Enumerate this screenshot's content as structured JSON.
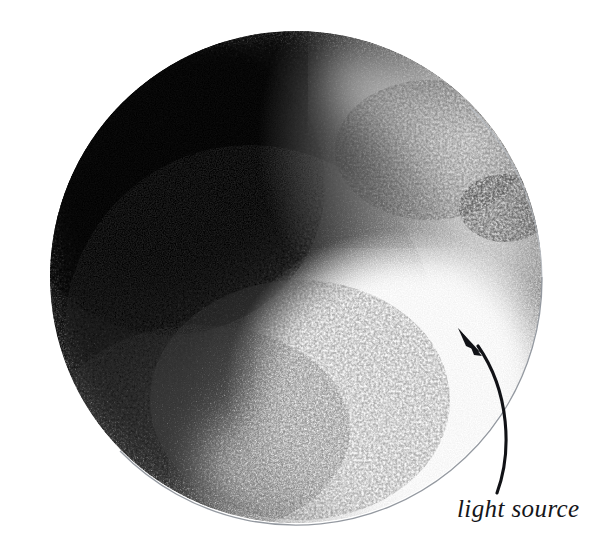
{
  "figure": {
    "kind": "pencil-shaded-sphere-diagram",
    "medium": "graphite / charcoal shading on white paper",
    "background_color": "#ffffff",
    "caption_text": "light source"
  },
  "sphere": {
    "name": "shaded-sphere",
    "center_x": 296,
    "center_y": 277,
    "radius": 246,
    "outline_color": "#9aa0a6",
    "outline_visible_arc": "lower-right",
    "core_shadow_color": "#0a0a0a",
    "midtone_color": "#4a4a4a",
    "highlight_color": "#ffffff",
    "reflected_light_color": "#c9c9c9",
    "shading_direction": "dark upper-left to light lower-right",
    "highlight_center_x": 390,
    "highlight_center_y": 380
  },
  "annotation": {
    "name": "light-source-annotation",
    "label": "light source",
    "label_x": 457,
    "label_y": 496,
    "arrow": {
      "color": "#111216",
      "tip_x": 458,
      "tip_y": 328,
      "tail_x": 497,
      "tail_y": 493,
      "curve": "concave-left",
      "points_toward": "sphere lit side"
    }
  },
  "colors": {
    "paper": "#ffffff",
    "ink": "#111216",
    "outline": "#9aa0a6",
    "shadow_darkest": "#050505"
  }
}
